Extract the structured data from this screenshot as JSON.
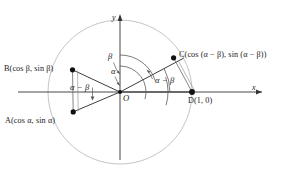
{
  "figure": {
    "type": "unit-circle-angle-difference-diagram",
    "background_color": "#ffffff",
    "line_color": "#1a1a1a",
    "circle_color": "#b9b9b9",
    "arc_color": "#5a5a5a",
    "origin": {
      "x": 120,
      "y": 92
    },
    "radius": 72
  },
  "axes": {
    "x_label": "x",
    "y_label": "y",
    "origin_label": "O"
  },
  "points": [
    {
      "id": "A",
      "label": "A(cos α, sin α)",
      "label_name": "point-label-a",
      "coord_text": "(cos α, sin α)",
      "angle_deg": -16,
      "px": {
        "x": 73,
        "y": 112
      },
      "label_pos": {
        "x": 6,
        "y": 117
      }
    },
    {
      "id": "B",
      "label": "B(cos β, sin β)",
      "label_name": "point-label-b",
      "coord_text": "(cos β, sin β)",
      "angle_deg": 18,
      "px": {
        "x": 72,
        "y": 70
      },
      "label_pos": {
        "x": 5,
        "y": 66
      }
    },
    {
      "id": "C",
      "label": "C(cos (α − β), sin (α − β))",
      "label_name": "point-label-c",
      "coord_text": "(cos (α − β), sin (α − β))",
      "angle_deg": 28,
      "px": {
        "x": 173,
        "y": 57
      },
      "label_pos": {
        "x": 180,
        "y": 53
      }
    },
    {
      "id": "D",
      "label": "D(1, 0)",
      "label_name": "point-label-d",
      "coord_text": "(1, 0)",
      "angle_deg": 0,
      "px": {
        "x": 192,
        "y": 92
      },
      "label_pos": {
        "x": 190,
        "y": 98
      }
    }
  ],
  "angles": [
    {
      "id": "beta",
      "label": "β",
      "label_name": "angle-label-beta",
      "label_pos": {
        "x": 111,
        "y": 57
      },
      "arc_radius": 37,
      "from_deg": 18,
      "to_deg": 90
    },
    {
      "id": "alpha",
      "label": "α",
      "label_name": "angle-label-alpha",
      "label_pos": {
        "x": 113,
        "y": 71
      },
      "arc_radius": 26,
      "from_deg": -16,
      "to_deg": 90
    },
    {
      "id": "alpha-minus-beta-left",
      "label": "α − β",
      "label_name": "angle-label-alpha-minus-beta-left",
      "label_pos": {
        "x": 72,
        "y": 87
      },
      "arc_radius": 48,
      "from_deg": -16,
      "to_deg": 18
    },
    {
      "id": "alpha-minus-beta-right",
      "label": "α − β",
      "label_name": "angle-label-alpha-minus-beta-right",
      "label_pos": {
        "x": 156,
        "y": 79
      },
      "arc_radius": 50,
      "from_deg": 0,
      "to_deg": 28
    }
  ],
  "chords": [
    {
      "id": "chord-AB",
      "from": "A",
      "to": "B"
    },
    {
      "id": "chord-CD",
      "from": "C",
      "to": "D"
    }
  ],
  "radii": [
    {
      "id": "radius-OA",
      "to": "A"
    },
    {
      "id": "radius-OB",
      "to": "B"
    },
    {
      "id": "radius-OC",
      "to": "C"
    },
    {
      "id": "radius-OD",
      "to": "D"
    }
  ]
}
